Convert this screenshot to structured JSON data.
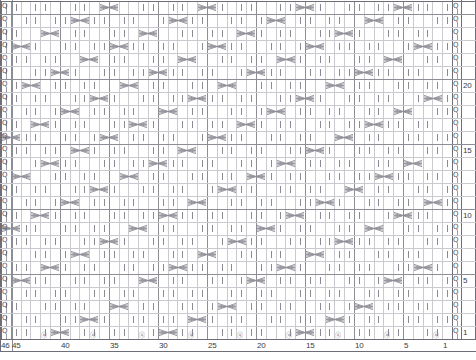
{
  "chart_data": {
    "type": "heatmap",
    "title": "",
    "xlabel": "",
    "ylabel": "",
    "grid": true,
    "legend_position": "none",
    "columns": 46,
    "rows": 26,
    "column_direction": "right-to-left",
    "row_direction": "bottom-to-top",
    "x_tick_labels": [
      "46",
      "45",
      "40",
      "35",
      "30",
      "25",
      "20",
      "15",
      "10",
      "5",
      "1"
    ],
    "x_tick_columns": [
      46,
      45,
      40,
      35,
      30,
      25,
      20,
      15,
      10,
      5,
      1
    ],
    "y_tick_labels": [
      "20",
      "15",
      "10",
      "5",
      "1"
    ],
    "y_tick_rows": [
      20,
      15,
      10,
      5,
      1
    ],
    "symbols": {
      "cable_cross": "X-shaped two-stitch cable crossing",
      "purl_dash": "vertical dash stitch mark",
      "twist_mark": "left-edge twisted stitch repeat symbol"
    },
    "cable_cells": [
      {
        "row": 26,
        "col_start": 5
      },
      {
        "row": 26,
        "col_start": 15
      },
      {
        "row": 26,
        "col_start": 25
      },
      {
        "row": 26,
        "col_start": 35
      },
      {
        "row": 25,
        "col_start": 8
      },
      {
        "row": 25,
        "col_start": 18
      },
      {
        "row": 25,
        "col_start": 28
      },
      {
        "row": 25,
        "col_start": 38
      },
      {
        "row": 24,
        "col_start": 11
      },
      {
        "row": 24,
        "col_start": 21
      },
      {
        "row": 24,
        "col_start": 31
      },
      {
        "row": 24,
        "col_start": 41
      },
      {
        "row": 23,
        "col_start": 3
      },
      {
        "row": 23,
        "col_start": 14
      },
      {
        "row": 23,
        "col_start": 24
      },
      {
        "row": 23,
        "col_start": 34
      },
      {
        "row": 23,
        "col_start": 44
      },
      {
        "row": 22,
        "col_start": 6
      },
      {
        "row": 22,
        "col_start": 17
      },
      {
        "row": 22,
        "col_start": 27
      },
      {
        "row": 22,
        "col_start": 37
      },
      {
        "row": 21,
        "col_start": 9
      },
      {
        "row": 21,
        "col_start": 20
      },
      {
        "row": 21,
        "col_start": 30
      },
      {
        "row": 21,
        "col_start": 40
      },
      {
        "row": 20,
        "col_start": 12
      },
      {
        "row": 20,
        "col_start": 23
      },
      {
        "row": 20,
        "col_start": 33
      },
      {
        "row": 20,
        "col_start": 43
      },
      {
        "row": 19,
        "col_start": 2
      },
      {
        "row": 19,
        "col_start": 15
      },
      {
        "row": 19,
        "col_start": 26
      },
      {
        "row": 19,
        "col_start": 36
      },
      {
        "row": 18,
        "col_start": 5
      },
      {
        "row": 18,
        "col_start": 18
      },
      {
        "row": 18,
        "col_start": 29
      },
      {
        "row": 18,
        "col_start": 39
      },
      {
        "row": 17,
        "col_start": 8
      },
      {
        "row": 17,
        "col_start": 21
      },
      {
        "row": 17,
        "col_start": 32
      },
      {
        "row": 17,
        "col_start": 42
      },
      {
        "row": 16,
        "col_start": 11
      },
      {
        "row": 16,
        "col_start": 24
      },
      {
        "row": 16,
        "col_start": 35
      },
      {
        "row": 16,
        "col_start": 45
      },
      {
        "row": 15,
        "col_start": 14
      },
      {
        "row": 15,
        "col_start": 27
      },
      {
        "row": 15,
        "col_start": 38
      },
      {
        "row": 14,
        "col_start": 4
      },
      {
        "row": 14,
        "col_start": 17
      },
      {
        "row": 14,
        "col_start": 30
      },
      {
        "row": 14,
        "col_start": 41
      },
      {
        "row": 13,
        "col_start": 7
      },
      {
        "row": 13,
        "col_start": 20
      },
      {
        "row": 13,
        "col_start": 33
      },
      {
        "row": 13,
        "col_start": 44
      },
      {
        "row": 12,
        "col_start": 10
      },
      {
        "row": 12,
        "col_start": 23
      },
      {
        "row": 12,
        "col_start": 36
      },
      {
        "row": 11,
        "col_start": 2
      },
      {
        "row": 11,
        "col_start": 13
      },
      {
        "row": 11,
        "col_start": 26
      },
      {
        "row": 11,
        "col_start": 39
      },
      {
        "row": 10,
        "col_start": 5
      },
      {
        "row": 10,
        "col_start": 16
      },
      {
        "row": 10,
        "col_start": 29
      },
      {
        "row": 10,
        "col_start": 42
      },
      {
        "row": 9,
        "col_start": 8
      },
      {
        "row": 9,
        "col_start": 19
      },
      {
        "row": 9,
        "col_start": 32
      },
      {
        "row": 9,
        "col_start": 45
      },
      {
        "row": 8,
        "col_start": 11
      },
      {
        "row": 8,
        "col_start": 22
      },
      {
        "row": 8,
        "col_start": 35
      },
      {
        "row": 7,
        "col_start": 14
      },
      {
        "row": 7,
        "col_start": 25
      },
      {
        "row": 7,
        "col_start": 38
      },
      {
        "row": 6,
        "col_start": 3
      },
      {
        "row": 6,
        "col_start": 17
      },
      {
        "row": 6,
        "col_start": 28
      },
      {
        "row": 6,
        "col_start": 41
      },
      {
        "row": 5,
        "col_start": 6
      },
      {
        "row": 5,
        "col_start": 20
      },
      {
        "row": 5,
        "col_start": 31
      },
      {
        "row": 5,
        "col_start": 44
      },
      {
        "row": 3,
        "col_start": 9
      },
      {
        "row": 3,
        "col_start": 23
      },
      {
        "row": 3,
        "col_start": 34
      },
      {
        "row": 2,
        "col_start": 12
      },
      {
        "row": 2,
        "col_start": 26
      },
      {
        "row": 2,
        "col_start": 37
      },
      {
        "row": 1,
        "col_start": 15
      },
      {
        "row": 1,
        "col_start": 29
      },
      {
        "row": 1,
        "col_start": 40
      }
    ]
  },
  "axes": {
    "bottom": {
      "name": "stitch-number-axis",
      "ticks": [
        {
          "label": "46",
          "col": 46
        },
        {
          "label": "45",
          "col": 45
        },
        {
          "label": "40",
          "col": 40
        },
        {
          "label": "35",
          "col": 35
        },
        {
          "label": "30",
          "col": 30
        },
        {
          "label": "25",
          "col": 25
        },
        {
          "label": "20",
          "col": 20
        },
        {
          "label": "15",
          "col": 15
        },
        {
          "label": "10",
          "col": 10
        },
        {
          "label": "5",
          "col": 5
        },
        {
          "label": "1",
          "col": 1
        }
      ]
    },
    "right": {
      "name": "row-number-axis",
      "ticks": [
        {
          "label": "20",
          "row": 20
        },
        {
          "label": "15",
          "row": 15
        },
        {
          "label": "10",
          "row": 10
        },
        {
          "label": "5",
          "row": 5
        },
        {
          "label": "1",
          "row": 1
        }
      ]
    }
  },
  "edge_column": {
    "name": "selvedge-repeat-column",
    "symbol": "Q"
  },
  "colors": {
    "grid_minor": "#c9c9cf",
    "grid_major": "#8d8d96",
    "frame": "#6e6e78",
    "glyph": "#8a8a93",
    "text": "#3a3a42",
    "background": "#ffffff"
  }
}
